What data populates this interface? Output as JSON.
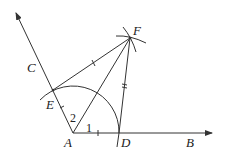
{
  "diagram": {
    "type": "geometric construction - angle bisector",
    "points": {
      "A": {
        "label": "A",
        "x": 73,
        "y": 133
      },
      "B": {
        "label": "B",
        "x": 212,
        "y": 133
      },
      "C": {
        "label": "C",
        "x": 16,
        "y": 13
      },
      "D": {
        "label": "D",
        "x": 119,
        "y": 133
      },
      "E": {
        "label": "E",
        "x": 53,
        "y": 90
      },
      "F": {
        "label": "F",
        "x": 130,
        "y": 38
      }
    },
    "angles": {
      "angle1": "1",
      "angle2": "2"
    },
    "segments": [
      "AB",
      "AC",
      "AF",
      "EF",
      "DF"
    ],
    "arcs": [
      "arc centered A through D and E",
      "arc near F from E",
      "arc near F from D"
    ],
    "colors": {
      "stroke": "#333333",
      "background": "#ffffff"
    }
  }
}
